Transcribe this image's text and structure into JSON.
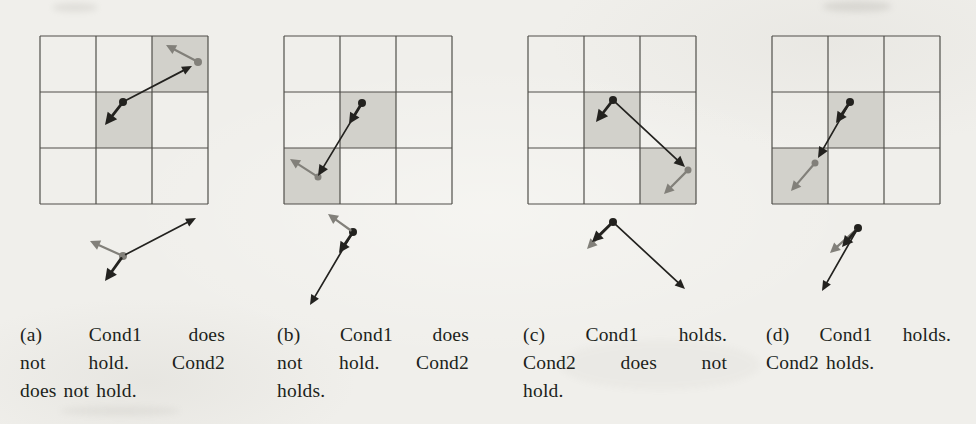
{
  "figure": {
    "name": "grid-condition-cases-figure",
    "colors": {
      "black": "#23221f",
      "gray": "#82807a",
      "shade": "#d2d1cb",
      "line": "#504f4a",
      "paper": "#f0efeb"
    },
    "panels": [
      {
        "id": "a",
        "caption": "(a) Cond1 does not hold. Cond2 does not hold.",
        "caption_lines": [
          {
            "text": "(a) Cond1 does",
            "justify": true
          },
          {
            "text": "not hold. Cond2",
            "justify": true
          },
          {
            "text": "does not hold.",
            "justify": false
          }
        ],
        "grid": {
          "x": 40,
          "y": 36,
          "cell": 56,
          "rows": 3,
          "cols": 3,
          "shaded": [
            [
              0,
              2
            ],
            [
              1,
              1
            ]
          ]
        },
        "dots": [
          {
            "x": 123,
            "y": 102,
            "r": 4,
            "color": "black"
          },
          {
            "x": 198,
            "y": 62,
            "r": 4,
            "color": "gray"
          },
          {
            "x": 123,
            "y": 256,
            "r": 4,
            "color": "gray"
          }
        ],
        "arrows": [
          {
            "x1": 123,
            "y1": 102,
            "x2": 192,
            "y2": 66,
            "color": "black",
            "w": 1.7,
            "head": [
              10,
              4.5
            ]
          },
          {
            "x1": 123,
            "y1": 102,
            "x2": 105,
            "y2": 125,
            "color": "black",
            "w": 2.8,
            "head": [
              12,
              6
            ]
          },
          {
            "x1": 198,
            "y1": 62,
            "x2": 166,
            "y2": 45,
            "color": "gray",
            "w": 2.2,
            "head": [
              10,
              5
            ]
          },
          {
            "x1": 123,
            "y1": 256,
            "x2": 196,
            "y2": 218,
            "color": "black",
            "w": 1.7,
            "head": [
              10,
              4.5
            ]
          },
          {
            "x1": 123,
            "y1": 256,
            "x2": 90,
            "y2": 241,
            "color": "gray",
            "w": 2.2,
            "head": [
              10,
              5
            ]
          },
          {
            "x1": 123,
            "y1": 256,
            "x2": 105,
            "y2": 281,
            "color": "black",
            "w": 2.8,
            "head": [
              12,
              6
            ]
          }
        ]
      },
      {
        "id": "b",
        "caption": "(b) Cond1 does not hold. Cond2 holds.",
        "caption_lines": [
          {
            "text": "(b) Cond1 does",
            "justify": true
          },
          {
            "text": "not hold. Cond2",
            "justify": true
          },
          {
            "text": "holds.",
            "justify": false
          }
        ],
        "grid": {
          "x": 40,
          "y": 36,
          "cell": 56,
          "rows": 3,
          "cols": 3,
          "shaded": [
            [
              1,
              1
            ],
            [
              2,
              0
            ]
          ]
        },
        "dots": [
          {
            "x": 118,
            "y": 103,
            "r": 4,
            "color": "black"
          },
          {
            "x": 74,
            "y": 177,
            "r": 3.5,
            "color": "gray"
          },
          {
            "x": 109,
            "y": 232,
            "r": 4,
            "color": "black"
          }
        ],
        "arrows": [
          {
            "x1": 118,
            "y1": 103,
            "x2": 74,
            "y2": 176,
            "color": "black",
            "w": 1.7,
            "head": [
              11,
              5
            ]
          },
          {
            "x1": 118,
            "y1": 103,
            "x2": 105,
            "y2": 124,
            "color": "black",
            "w": 2.8,
            "head": [
              11,
              5.5
            ]
          },
          {
            "x1": 74,
            "y1": 177,
            "x2": 46,
            "y2": 159,
            "color": "gray",
            "w": 2.2,
            "head": [
              10,
              5
            ]
          },
          {
            "x1": 109,
            "y1": 232,
            "x2": 84,
            "y2": 214,
            "color": "gray",
            "w": 2.2,
            "head": [
              10,
              5
            ]
          },
          {
            "x1": 109,
            "y1": 232,
            "x2": 95,
            "y2": 253,
            "color": "black",
            "w": 2.8,
            "head": [
              11,
              5.5
            ]
          },
          {
            "x1": 109,
            "y1": 232,
            "x2": 66,
            "y2": 305,
            "color": "black",
            "w": 1.7,
            "head": [
              10,
              4.5
            ]
          }
        ]
      },
      {
        "id": "c",
        "caption": "(c) Cond1 holds. Cond2 does not hold.",
        "caption_lines": [
          {
            "text": "(c) Cond1 holds.",
            "justify": true
          },
          {
            "text": "Cond2 does not",
            "justify": true
          },
          {
            "text": "hold.",
            "justify": false
          }
        ],
        "grid": {
          "x": 40,
          "y": 36,
          "cell": 56,
          "rows": 3,
          "cols": 3,
          "shaded": [
            [
              1,
              1
            ],
            [
              2,
              2
            ]
          ]
        },
        "dots": [
          {
            "x": 125,
            "y": 100,
            "r": 4,
            "color": "black"
          },
          {
            "x": 200,
            "y": 170,
            "r": 3.5,
            "color": "gray"
          },
          {
            "x": 125,
            "y": 222,
            "r": 4,
            "color": "black"
          }
        ],
        "arrows": [
          {
            "x1": 125,
            "y1": 100,
            "x2": 108,
            "y2": 122,
            "color": "black",
            "w": 2.8,
            "head": [
              12,
              6
            ]
          },
          {
            "x1": 125,
            "y1": 100,
            "x2": 197,
            "y2": 167,
            "color": "black",
            "w": 1.7,
            "head": [
              11,
              5
            ]
          },
          {
            "x1": 200,
            "y1": 170,
            "x2": 176,
            "y2": 194,
            "color": "gray",
            "w": 2.2,
            "head": [
              10,
              5
            ]
          },
          {
            "x1": 125,
            "y1": 222,
            "x2": 99,
            "y2": 249,
            "color": "gray",
            "w": 2.2,
            "head": [
              10,
              5
            ]
          },
          {
            "x1": 125,
            "y1": 222,
            "x2": 104,
            "y2": 242,
            "color": "black",
            "w": 2.8,
            "head": [
              11,
              5.5
            ]
          },
          {
            "x1": 125,
            "y1": 222,
            "x2": 197,
            "y2": 289,
            "color": "black",
            "w": 1.7,
            "head": [
              10,
              4.5
            ]
          }
        ]
      },
      {
        "id": "d",
        "caption": "(d) Cond1 holds. Cond2 holds.",
        "caption_lines": [
          {
            "text": "(d) Cond1 holds.",
            "justify": true
          },
          {
            "text": "Cond2 holds.",
            "justify": false
          }
        ],
        "grid": {
          "x": 40,
          "y": 36,
          "cell": 56,
          "rows": 3,
          "cols": 3,
          "shaded": [
            [
              1,
              1
            ],
            [
              2,
              0
            ]
          ]
        },
        "dots": [
          {
            "x": 118,
            "y": 102,
            "r": 4,
            "color": "black"
          },
          {
            "x": 83,
            "y": 163,
            "r": 3.5,
            "color": "gray"
          },
          {
            "x": 126,
            "y": 228,
            "r": 4,
            "color": "black"
          }
        ],
        "arrows": [
          {
            "x1": 118,
            "y1": 102,
            "x2": 104,
            "y2": 123,
            "color": "black",
            "w": 2.8,
            "head": [
              11,
              5.5
            ]
          },
          {
            "x1": 118,
            "y1": 102,
            "x2": 86,
            "y2": 158,
            "color": "black",
            "w": 1.7,
            "head": [
              11,
              5
            ]
          },
          {
            "x1": 83,
            "y1": 163,
            "x2": 59,
            "y2": 191,
            "color": "gray",
            "w": 2.2,
            "head": [
              10,
              5
            ]
          },
          {
            "x1": 126,
            "y1": 228,
            "x2": 98,
            "y2": 253,
            "color": "gray",
            "w": 2.2,
            "head": [
              10,
              5
            ]
          },
          {
            "x1": 126,
            "y1": 228,
            "x2": 110,
            "y2": 247,
            "color": "black",
            "w": 2.8,
            "head": [
              11,
              5.5
            ]
          },
          {
            "x1": 126,
            "y1": 228,
            "x2": 90,
            "y2": 291,
            "color": "black",
            "w": 1.7,
            "head": [
              10,
              4.5
            ]
          }
        ]
      }
    ]
  }
}
